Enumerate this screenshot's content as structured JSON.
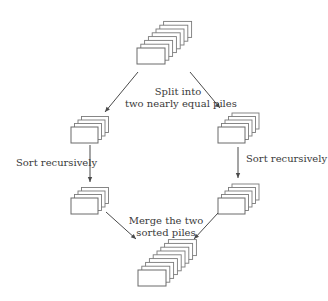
{
  "diagram": {
    "colors": {
      "card_stroke": "#6a6a6a",
      "arrow": "#4a4a4a",
      "text": "#3a3a3a",
      "background": "#ffffff"
    },
    "piles": [
      {
        "id": "unsorted-pile",
        "cards": 8,
        "front": {
          "x": 137,
          "y": 48,
          "w": 28,
          "h": 16
        },
        "step": {
          "dx": 3.8,
          "dy": -3.8
        }
      },
      {
        "id": "left-half-pile",
        "cards": 4,
        "front": {
          "x": 71,
          "y": 127,
          "w": 27,
          "h": 16
        },
        "step": {
          "dx": 3.5,
          "dy": -3.5
        }
      },
      {
        "id": "right-half-pile",
        "cards": 5,
        "front": {
          "x": 218,
          "y": 127,
          "w": 27,
          "h": 16
        },
        "step": {
          "dx": 3.5,
          "dy": -3.5
        }
      },
      {
        "id": "left-sorted-pile",
        "cards": 4,
        "front": {
          "x": 71,
          "y": 198,
          "w": 27,
          "h": 16
        },
        "step": {
          "dx": 3.5,
          "dy": -3.5
        }
      },
      {
        "id": "right-sorted-pile",
        "cards": 5,
        "front": {
          "x": 218,
          "y": 198,
          "w": 27,
          "h": 16
        },
        "step": {
          "dx": 3.5,
          "dy": -3.5
        }
      },
      {
        "id": "merged-pile",
        "cards": 9,
        "front": {
          "x": 138,
          "y": 270,
          "w": 28,
          "h": 16
        },
        "step": {
          "dx": 3.8,
          "dy": -3.8
        }
      }
    ],
    "arrows": [
      {
        "id": "split-left-arrow",
        "x1": 138,
        "y1": 72,
        "x2": 105,
        "y2": 112
      },
      {
        "id": "split-right-arrow",
        "x1": 190,
        "y1": 72,
        "x2": 220,
        "y2": 108
      },
      {
        "id": "sort-left-arrow",
        "x1": 90,
        "y1": 145,
        "x2": 90,
        "y2": 182
      },
      {
        "id": "sort-right-arrow",
        "x1": 238,
        "y1": 147,
        "x2": 238,
        "y2": 178
      },
      {
        "id": "merge-left-arrow",
        "x1": 106,
        "y1": 212,
        "x2": 136,
        "y2": 239
      },
      {
        "id": "merge-right-arrow",
        "x1": 218,
        "y1": 213,
        "x2": 194,
        "y2": 239
      }
    ],
    "labels": {
      "split": {
        "line1": "Split into",
        "line2": "two nearly equal piles"
      },
      "sort_left": "Sort recursively",
      "sort_right": "Sort recursively",
      "merge": {
        "line1": "Merge the two",
        "line2": "sorted piles"
      }
    }
  }
}
